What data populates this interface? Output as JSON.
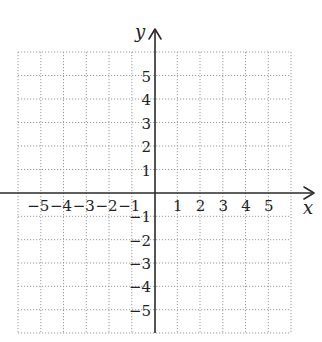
{
  "diagram": {
    "type": "coordinate-plane",
    "axes": {
      "x_label": "x",
      "y_label": "y",
      "x_range": [
        -6,
        6
      ],
      "y_range": [
        -6,
        6
      ]
    },
    "x_ticks": [
      {
        "value": -5,
        "label": "−5"
      },
      {
        "value": -4,
        "label": "−4"
      },
      {
        "value": -3,
        "label": "−3"
      },
      {
        "value": -2,
        "label": "−2"
      },
      {
        "value": -1,
        "label": "−1"
      },
      {
        "value": 1,
        "label": "1"
      },
      {
        "value": 2,
        "label": "2"
      },
      {
        "value": 3,
        "label": "3"
      },
      {
        "value": 4,
        "label": "4"
      },
      {
        "value": 5,
        "label": "5"
      }
    ],
    "y_ticks": [
      {
        "value": 5,
        "label": "5"
      },
      {
        "value": 4,
        "label": "4"
      },
      {
        "value": 3,
        "label": "3"
      },
      {
        "value": 2,
        "label": "2"
      },
      {
        "value": 1,
        "label": "1"
      },
      {
        "value": -1,
        "label": "−1"
      },
      {
        "value": -2,
        "label": "−2"
      },
      {
        "value": -3,
        "label": "−3"
      },
      {
        "value": -4,
        "label": "−4"
      },
      {
        "value": -5,
        "label": "−5"
      }
    ],
    "grid": {
      "columns": 12,
      "rows": 12,
      "style": "dotted"
    },
    "colors": {
      "axis": "#2a2a2a",
      "grid": "#9a9a9a",
      "text": "#222222",
      "background": "#ffffff"
    }
  }
}
